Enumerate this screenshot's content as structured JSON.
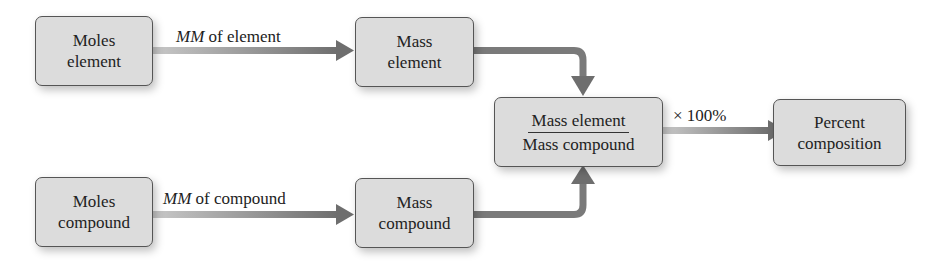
{
  "diagram": {
    "nodes": {
      "moles_element": {
        "line1": "Moles",
        "line2": "element"
      },
      "mass_element": {
        "line1": "Mass",
        "line2": "element"
      },
      "moles_compound": {
        "line1": "Moles",
        "line2": "compound"
      },
      "mass_compound": {
        "line1": "Mass",
        "line2": "compound"
      },
      "ratio": {
        "numerator": "Mass element",
        "denominator": "Mass compound"
      },
      "percent": {
        "line1": "Percent",
        "line2": "composition"
      }
    },
    "edges": {
      "element_label": {
        "italic": "MM",
        "rest": " of element"
      },
      "compound_label": {
        "italic": "MM",
        "rest": " of compound"
      },
      "ratio_label": "× 100%"
    },
    "colors": {
      "box_fill": "#dcdcdc",
      "box_border": "#555555",
      "arrow": "#7a7a7a",
      "text": "#222222"
    }
  }
}
